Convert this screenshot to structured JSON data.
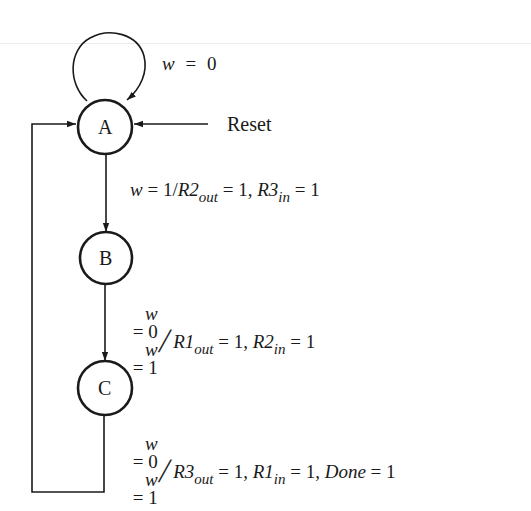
{
  "diagram": {
    "type": "finite-state-machine",
    "states": [
      {
        "id": "A",
        "label": "A",
        "cx": 105,
        "cy": 127,
        "r": 27
      },
      {
        "id": "B",
        "label": "B",
        "cx": 106,
        "cy": 258,
        "r": 26
      },
      {
        "id": "C",
        "label": "C",
        "cx": 105,
        "cy": 388,
        "r": 27
      }
    ],
    "reset_label": "Reset",
    "transitions": {
      "a_self": {
        "from": "A",
        "to": "A",
        "condition_var": "w",
        "condition_eq": "=",
        "condition_val": "0"
      },
      "a_to_b": {
        "from": "A",
        "to": "B",
        "cond_var": "w",
        "cond_eq": " = ",
        "cond_val": "1",
        "slash": "/",
        "out1_reg": "R2",
        "out1_sub": "out",
        "out1_val": " = 1, ",
        "out2_reg": "R3",
        "out2_sub": "in",
        "out2_val": " = 1"
      },
      "b_to_c": {
        "from": "B",
        "to": "C",
        "cond1_var": "w",
        "cond1_rest": " = 0",
        "cond2_var": "w",
        "cond2_rest": " = 1",
        "slash": "/",
        "out1_reg": "R1",
        "out1_sub": "out",
        "out1_val": " = 1, ",
        "out2_reg": "R2",
        "out2_sub": "in",
        "out2_val": " = 1"
      },
      "c_to_a": {
        "from": "C",
        "to": "A",
        "cond1_var": "w",
        "cond1_rest": " = 0",
        "cond2_var": "w",
        "cond2_rest": " = 1",
        "slash": "/",
        "out1_reg": "R3",
        "out1_sub": "out",
        "out1_val": " = 1, ",
        "out2_reg": "R1",
        "out2_sub": "in",
        "out2_val": " = 1, ",
        "out3_name": "Done",
        "out3_val": " = 1"
      }
    },
    "colors": {
      "stroke": "#1a1a1a",
      "background": "#ffffff"
    }
  }
}
